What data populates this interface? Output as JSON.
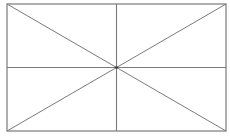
{
  "diagram": {
    "rect": {
      "x": 7,
      "y": 4,
      "width": 219,
      "height": 127
    },
    "center": {
      "x": 116.5,
      "y": 67.5
    },
    "stroke_color": "#7a7a7a",
    "center_color": "#333333",
    "background": "#ffffff"
  }
}
